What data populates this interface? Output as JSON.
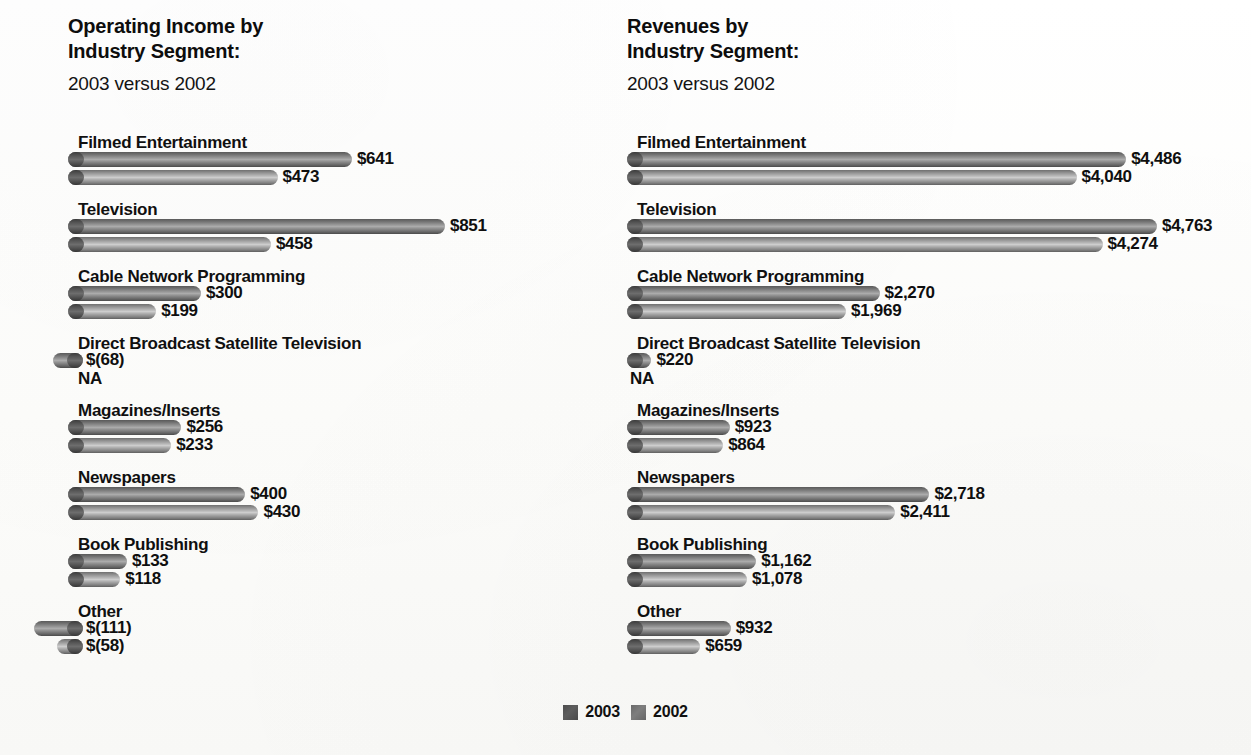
{
  "legend": {
    "items": [
      {
        "label": "2003",
        "color": "#555555"
      },
      {
        "label": "2002",
        "color": "#777777"
      }
    ]
  },
  "charts": [
    {
      "id": "operating-income",
      "title_main": "Operating Income by\nIndustry Segment:",
      "title_sub": "2003 versus 2002"
    },
    {
      "id": "revenues",
      "title_main": "Revenues by\nIndustry Segment:",
      "title_sub": "2003 versus 2002"
    }
  ],
  "chart_data": [
    {
      "type": "bar",
      "orientation": "horizontal",
      "title": "Operating Income by Industry Segment: 2003 versus 2002",
      "subtitle": "2003 versus 2002",
      "xlabel": "",
      "ylabel": "",
      "unit": "$ millions",
      "grid": false,
      "legend_position": "bottom-center",
      "xlim": [
        -111,
        851
      ],
      "categories": [
        "Filmed Entertainment",
        "Television",
        "Cable Network Programming",
        "Direct Broadcast Satellite Television",
        "Magazines/Inserts",
        "Newspapers",
        "Book Publishing",
        "Other"
      ],
      "series": [
        {
          "name": "2003",
          "values": [
            641,
            851,
            300,
            -68,
            256,
            400,
            133,
            -111
          ],
          "labels": [
            "$641",
            "$851",
            "$300",
            "$(68)",
            "$256",
            "$400",
            "$133",
            "$(111)"
          ]
        },
        {
          "name": "2002",
          "values": [
            473,
            458,
            199,
            null,
            233,
            430,
            118,
            -58
          ],
          "labels": [
            "$473",
            "$458",
            "$199",
            "NA",
            "$233",
            "$430",
            "$118",
            "$(58)"
          ]
        }
      ]
    },
    {
      "type": "bar",
      "orientation": "horizontal",
      "title": "Revenues by Industry Segment: 2003 versus 2002",
      "subtitle": "2003 versus 2002",
      "xlabel": "",
      "ylabel": "",
      "unit": "$ millions",
      "grid": false,
      "legend_position": "bottom-center",
      "xlim": [
        0,
        4763
      ],
      "categories": [
        "Filmed Entertainment",
        "Television",
        "Cable Network Programming",
        "Direct Broadcast Satellite Television",
        "Magazines/Inserts",
        "Newspapers",
        "Book Publishing",
        "Other"
      ],
      "series": [
        {
          "name": "2003",
          "values": [
            4486,
            4763,
            2270,
            220,
            923,
            2718,
            1162,
            932
          ],
          "labels": [
            "$4,486",
            "$4,763",
            "$2,270",
            "$220",
            "$923",
            "$2,718",
            "$1,162",
            "$932"
          ]
        },
        {
          "name": "2002",
          "values": [
            4040,
            4274,
            1969,
            null,
            864,
            2411,
            1078,
            659
          ],
          "labels": [
            "$4,040",
            "$4,274",
            "$1,969",
            "NA",
            "$864",
            "$2,411",
            "$1,078",
            "$659"
          ]
        }
      ]
    }
  ]
}
